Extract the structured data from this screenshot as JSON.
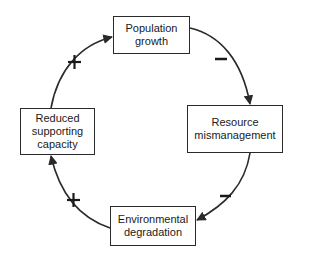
{
  "diagram": {
    "type": "causal-loop",
    "nodes": [
      {
        "id": "population",
        "lines": [
          "Population",
          "growth"
        ]
      },
      {
        "id": "resource",
        "lines": [
          "Resource",
          "mismanagement"
        ]
      },
      {
        "id": "environment",
        "lines": [
          "Environmental",
          "degradation"
        ]
      },
      {
        "id": "reduced",
        "lines": [
          "Reduced",
          "supporting",
          "capacity"
        ]
      }
    ],
    "edges": [
      {
        "from": "population",
        "to": "resource",
        "sign": "−"
      },
      {
        "from": "resource",
        "to": "environment",
        "sign": "−"
      },
      {
        "from": "environment",
        "to": "reduced",
        "sign": "+"
      },
      {
        "from": "reduced",
        "to": "population",
        "sign": "+"
      }
    ],
    "colors": {
      "line": "#2a2a2a",
      "background": "#ffffff"
    }
  }
}
